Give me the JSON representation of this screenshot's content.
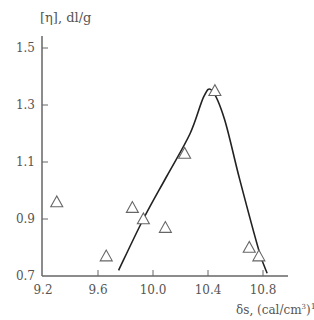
{
  "chart_data": {
    "type": "scatter",
    "title": "",
    "xlabel": "δs, (cal/cm³)^1/2",
    "ylabel": "[η], dl/g",
    "xlim": [
      9.2,
      11.0
    ],
    "ylim": [
      0.7,
      1.5
    ],
    "x_ticks": [
      "9.2",
      "9.6",
      "10.0",
      "10.4",
      "10.8"
    ],
    "y_ticks": [
      "0.7",
      "0.9",
      "1.1",
      "1.3",
      "1.5"
    ],
    "grid": false,
    "legend": null,
    "series": [
      {
        "name": "measured",
        "marker": "open-triangle",
        "points": [
          {
            "x": 9.3,
            "y": 0.96
          },
          {
            "x": 9.66,
            "y": 0.77
          },
          {
            "x": 9.85,
            "y": 0.94
          },
          {
            "x": 9.93,
            "y": 0.9
          },
          {
            "x": 10.09,
            "y": 0.87
          },
          {
            "x": 10.23,
            "y": 1.13
          },
          {
            "x": 10.45,
            "y": 1.35
          },
          {
            "x": 10.7,
            "y": 0.8
          },
          {
            "x": 10.77,
            "y": 0.77
          }
        ]
      },
      {
        "name": "trend curve",
        "marker": "line",
        "points": [
          {
            "x": 9.75,
            "y": 0.72
          },
          {
            "x": 9.93,
            "y": 0.9
          },
          {
            "x": 10.1,
            "y": 1.05
          },
          {
            "x": 10.27,
            "y": 1.2
          },
          {
            "x": 10.37,
            "y": 1.33
          },
          {
            "x": 10.43,
            "y": 1.35
          },
          {
            "x": 10.52,
            "y": 1.25
          },
          {
            "x": 10.63,
            "y": 1.04
          },
          {
            "x": 10.77,
            "y": 0.79
          },
          {
            "x": 10.83,
            "y": 0.71
          }
        ]
      }
    ]
  },
  "labels": {
    "ylabel": "[η], dl/g",
    "xlabel_main": "δs, (cal/cm",
    "xlabel_sup1": "3",
    "xlabel_close": ")",
    "xlabel_sup2": "1/2"
  }
}
